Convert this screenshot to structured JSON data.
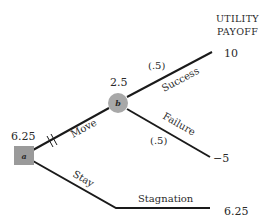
{
  "header": {
    "line1": "UTILITY",
    "line2": "PAYOFF"
  },
  "nodes": {
    "a": {
      "label": "a",
      "type": "decision",
      "value": "6.25",
      "fill": "#9a9a9a"
    },
    "b": {
      "label": "b",
      "type": "chance",
      "value": "2.5",
      "fill": "#a8a8a8"
    }
  },
  "branches": {
    "move": {
      "label": "Move"
    },
    "stay": {
      "label": "Stay"
    },
    "success": {
      "label": "Success",
      "probability": "(.5)"
    },
    "failure": {
      "label": "Failure",
      "probability": "(.5)"
    },
    "stagnation": {
      "label": "Stagnation"
    }
  },
  "payoffs": {
    "success": "10",
    "failure": "−5",
    "stagnation": "6.25"
  }
}
